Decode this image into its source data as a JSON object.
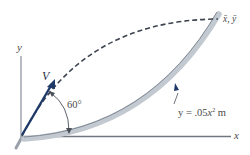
{
  "figure": {
    "type": "projectile-onto-parabolic-track",
    "axes": {
      "x_label": "x",
      "y_label": "y"
    },
    "velocity": {
      "label": "V",
      "angle_label": "60°",
      "angle_deg": 60,
      "color": "#1f3a68"
    },
    "track": {
      "equation_prefix": "y = .05",
      "equation_var": "x",
      "equation_exp": "2",
      "equation_unit": " m",
      "color": "#b9c0c8"
    },
    "landing_point": {
      "label": "x̄, ȳ"
    },
    "trajectory": {
      "style": "dashed",
      "color": "#3e4450"
    }
  }
}
